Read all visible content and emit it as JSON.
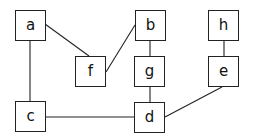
{
  "diagram": {
    "type": "undirected-graph",
    "nodes": [
      {
        "id": "a",
        "label": "a",
        "x": 15,
        "y": 10
      },
      {
        "id": "b",
        "label": "b",
        "x": 135,
        "y": 10
      },
      {
        "id": "h",
        "label": "h",
        "x": 208,
        "y": 10
      },
      {
        "id": "f",
        "label": "f",
        "x": 75,
        "y": 56
      },
      {
        "id": "g",
        "label": "g",
        "x": 134,
        "y": 56
      },
      {
        "id": "e",
        "label": "e",
        "x": 208,
        "y": 56
      },
      {
        "id": "c",
        "label": "c",
        "x": 15,
        "y": 101
      },
      {
        "id": "d",
        "label": "d",
        "x": 134,
        "y": 102
      }
    ],
    "edges": [
      {
        "from": "a",
        "to": "f"
      },
      {
        "from": "a",
        "to": "c"
      },
      {
        "from": "b",
        "to": "f"
      },
      {
        "from": "b",
        "to": "g"
      },
      {
        "from": "g",
        "to": "d"
      },
      {
        "from": "h",
        "to": "e"
      },
      {
        "from": "e",
        "to": "d"
      },
      {
        "from": "c",
        "to": "d"
      }
    ]
  }
}
